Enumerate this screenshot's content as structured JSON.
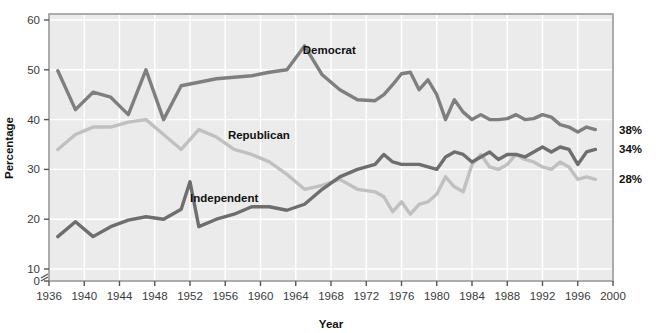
{
  "chart_data": {
    "type": "line",
    "title": "",
    "xlabel": "Year",
    "ylabel": "Percentage",
    "xlim": [
      1936,
      2000
    ],
    "ylim": [
      0,
      60
    ],
    "y_axis_break": true,
    "y_break_between": [
      0,
      10
    ],
    "grid": true,
    "legend_position": "inline-labels",
    "xticks": [
      1936,
      1940,
      1944,
      1948,
      1952,
      1956,
      1960,
      1964,
      1968,
      1972,
      1976,
      1980,
      1984,
      1988,
      1992,
      1996,
      2000
    ],
    "yticks": [
      0,
      10,
      20,
      30,
      40,
      50,
      60
    ],
    "series": [
      {
        "name": "Democrat",
        "color": "#7f7f7f",
        "end_label": "38%",
        "label_x": 1964.8,
        "label_y": 53.2,
        "x": [
          1937,
          1939,
          1941,
          1943,
          1945,
          1947,
          1949,
          1951,
          1953,
          1955,
          1957,
          1959,
          1961,
          1963,
          1965,
          1967,
          1969,
          1971,
          1973,
          1974,
          1975,
          1976,
          1977,
          1978,
          1979,
          1980,
          1981,
          1982,
          1983,
          1984,
          1985,
          1986,
          1987,
          1988,
          1989,
          1990,
          1991,
          1992,
          1993,
          1994,
          1995,
          1996,
          1997,
          1998
        ],
        "y": [
          49.8,
          42.0,
          45.5,
          44.5,
          41.0,
          50.0,
          40.0,
          46.8,
          47.5,
          48.2,
          48.5,
          48.8,
          49.5,
          50.0,
          54.8,
          49.0,
          46.0,
          44.0,
          43.8,
          45.0,
          47.0,
          49.2,
          49.5,
          46.0,
          48.0,
          45.0,
          40.0,
          44.0,
          41.5,
          40.0,
          41.0,
          40.0,
          40.0,
          40.2,
          41.0,
          40.0,
          40.2,
          41.0,
          40.5,
          39.0,
          38.5,
          37.5,
          38.5,
          38.0
        ]
      },
      {
        "name": "Republican",
        "color": "#c0c0c0",
        "end_label": "28%",
        "label_x": 1956.3,
        "label_y": 36.2,
        "x": [
          1937,
          1939,
          1941,
          1943,
          1945,
          1947,
          1949,
          1951,
          1953,
          1955,
          1957,
          1959,
          1961,
          1963,
          1965,
          1967,
          1969,
          1971,
          1973,
          1974,
          1975,
          1976,
          1977,
          1978,
          1979,
          1980,
          1981,
          1982,
          1983,
          1984,
          1985,
          1986,
          1987,
          1988,
          1989,
          1990,
          1991,
          1992,
          1993,
          1994,
          1995,
          1996,
          1997,
          1998
        ],
        "y": [
          34.0,
          37.0,
          38.5,
          38.5,
          39.5,
          40.0,
          37.0,
          34.0,
          38.0,
          36.5,
          34.0,
          33.0,
          31.5,
          29.0,
          26.0,
          26.8,
          28.0,
          26.0,
          25.5,
          24.5,
          21.5,
          23.5,
          21.0,
          23.0,
          23.5,
          25.0,
          28.5,
          26.5,
          25.5,
          31.0,
          33.0,
          30.5,
          30.0,
          31.0,
          33.0,
          32.0,
          31.5,
          30.5,
          30.0,
          31.5,
          30.5,
          28.0,
          28.5,
          28.0
        ]
      },
      {
        "name": "Independent",
        "color": "#6e6e6e",
        "end_label": "34%",
        "label_x": 1952.0,
        "label_y": 23.5,
        "x": [
          1937,
          1939,
          1941,
          1943,
          1945,
          1947,
          1949,
          1951,
          1952,
          1953,
          1955,
          1957,
          1959,
          1961,
          1963,
          1965,
          1967,
          1969,
          1971,
          1973,
          1974,
          1975,
          1976,
          1977,
          1978,
          1979,
          1980,
          1981,
          1982,
          1983,
          1984,
          1985,
          1986,
          1987,
          1988,
          1989,
          1990,
          1991,
          1992,
          1993,
          1994,
          1995,
          1996,
          1997,
          1998
        ],
        "y": [
          16.5,
          19.5,
          16.5,
          18.5,
          19.8,
          20.5,
          20.0,
          22.0,
          27.5,
          18.5,
          20.0,
          21.0,
          22.5,
          22.5,
          21.8,
          23.0,
          26.0,
          28.5,
          30.0,
          31.0,
          33.0,
          31.5,
          31.0,
          31.0,
          31.0,
          30.5,
          30.0,
          32.5,
          33.5,
          33.0,
          31.5,
          32.5,
          33.5,
          32.0,
          33.0,
          33.0,
          32.5,
          33.5,
          34.5,
          33.5,
          34.5,
          34.0,
          31.0,
          33.5,
          34.0
        ]
      }
    ]
  },
  "axis": {
    "y_title": "Percentage",
    "x_title": "Year",
    "y_tick_labels": [
      "0",
      "10",
      "20",
      "30",
      "40",
      "50",
      "60"
    ],
    "x_tick_labels": [
      "1936",
      "1940",
      "1944",
      "1948",
      "1952",
      "1956",
      "1960",
      "1964",
      "1968",
      "1972",
      "1976",
      "1980",
      "1984",
      "1988",
      "1992",
      "1996",
      "2000"
    ]
  },
  "colors": {
    "plot_background": "#ebebeb",
    "grid": "#ffffff",
    "frame": "#9a9a9a",
    "democrat": "#7f7f7f",
    "republican": "#c0c0c0",
    "independent": "#6e6e6e",
    "text": "#3a3a3a"
  },
  "labels": {
    "democrat": "Democrat",
    "republican": "Republican",
    "independent": "Independent",
    "democrat_end": "38%",
    "independent_end": "34%",
    "republican_end": "28%"
  }
}
